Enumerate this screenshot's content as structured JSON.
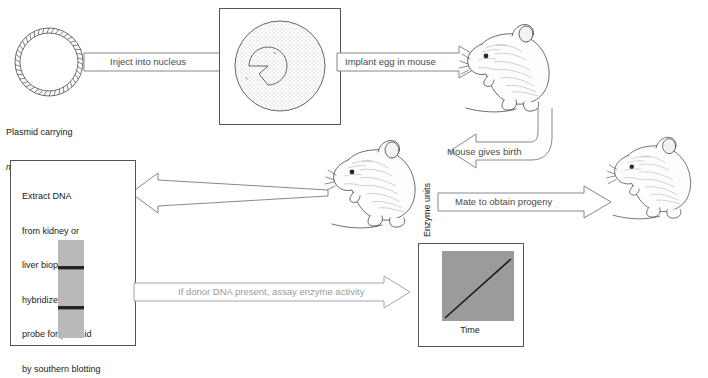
{
  "figure": {
    "caption": ""
  },
  "plasmid": {
    "name": "plasmid-ring",
    "label_line1": "Plasmid carrying",
    "label_italic": "mt-tk",
    "label_line2_rest": " fusion gene"
  },
  "arrows": {
    "inject": "Inject into nucleus",
    "implant": "Implant egg in mouse",
    "birth": "Mouse gives birth",
    "mate": "Mate to obtain progeny",
    "assay": "If donor DNA present, assay enzyme activity",
    "extract_to_box": ""
  },
  "egg": {
    "name": "fertilized-egg",
    "cell_label": "",
    "nucleus_label": ""
  },
  "mice": [
    {
      "name": "mouse-implanted",
      "label": ""
    },
    {
      "name": "mouse-pregnant",
      "label": ""
    },
    {
      "name": "mouse-progeny",
      "label": ""
    }
  ],
  "analysis_box": {
    "text_lines": [
      "Extract DNA",
      "from kidney or",
      "liver biopsy;",
      "hybridize with",
      "probe for plasmid",
      "by southern blotting"
    ],
    "blot": {
      "name": "southern-blot-lane",
      "lane_color": "#b9b9b9",
      "band_color": "#2b2b2b",
      "bands": [
        2
      ]
    }
  },
  "chart_data": {
    "type": "line",
    "title": "",
    "xlabel": "Time",
    "ylabel": "Enzyme units",
    "x": [
      0,
      1
    ],
    "values": [
      0,
      1
    ],
    "xlim": [
      0,
      1
    ],
    "ylim": [
      0,
      1
    ],
    "grid": false,
    "legend": "none",
    "plot_bg": "#9b9b9b",
    "line_color": "#1a1a1a",
    "series": [
      {
        "name": "enzyme activity",
        "values": [
          0,
          1
        ]
      }
    ],
    "annotation": "Linear increase of enzyme units over time"
  },
  "colors": {
    "frame": "#555555",
    "arrow_outline": "#6a6a6a",
    "stipple": "#cfcfcf",
    "text": "#222222",
    "muted_text": "#4a4a4a"
  }
}
